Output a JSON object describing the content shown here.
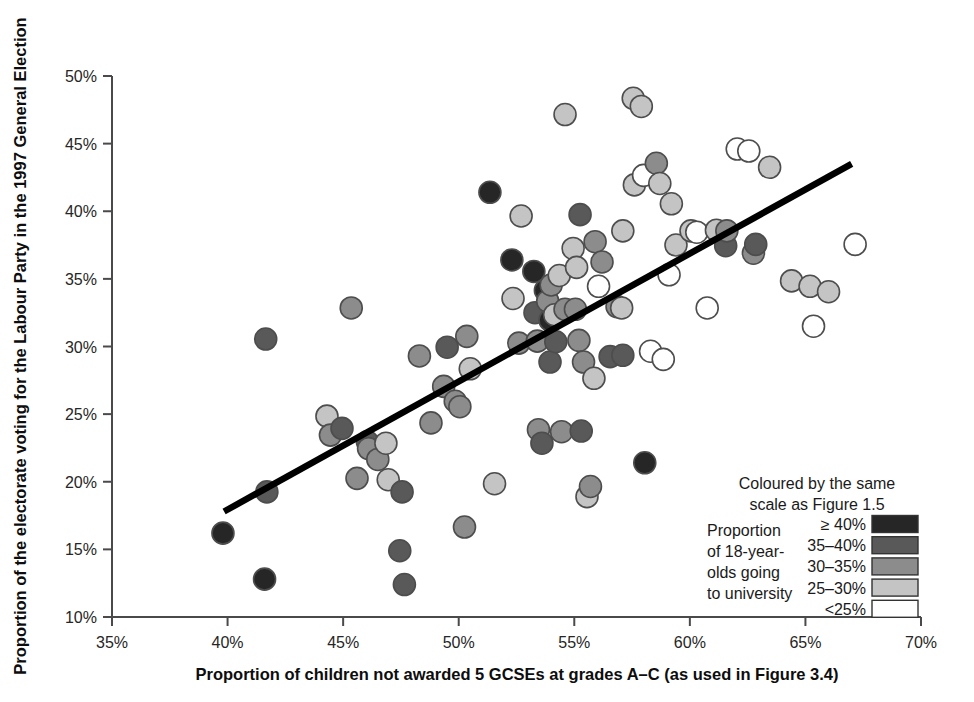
{
  "chart_data": {
    "type": "scatter",
    "title": "",
    "xlabel": "Proportion of children not awarded 5 GCSEs at grades A–C (as used in Figure 3.4)",
    "ylabel": "Proportion of the electorate voting for the Labour Party in the 1997 General Election",
    "xlim": [
      35,
      70
    ],
    "ylim": [
      10,
      50
    ],
    "xticks": [
      "35%",
      "40%",
      "45%",
      "50%",
      "55%",
      "60%",
      "65%",
      "70%"
    ],
    "xtick_values": [
      35,
      40,
      45,
      50,
      55,
      60,
      65,
      70
    ],
    "yticks": [
      "10%",
      "15%",
      "20%",
      "25%",
      "30%",
      "35%",
      "40%",
      "45%",
      "50%"
    ],
    "ytick_values": [
      10,
      15,
      20,
      25,
      30,
      35,
      40,
      45,
      50
    ],
    "grid": false,
    "legend_position": "bottom-right",
    "trendline": {
      "type": "linear",
      "x_start": 39.85,
      "y_start": 17.8,
      "x_end": 67.0,
      "y_end": 43.5
    },
    "color_scale": {
      "bins": [
        ">=40%",
        "35-40%",
        "30-35%",
        "25-30%",
        "<25%"
      ],
      "colors": [
        "#262626",
        "#595959",
        "#8c8c8c",
        "#c4c4c4",
        "#ffffff"
      ]
    },
    "series": [
      {
        "name": "Parliamentary constituencies",
        "point_size_px": 11,
        "points": [
          {
            "x": 39.8,
            "y": 16.2,
            "bin": 0
          },
          {
            "x": 41.6,
            "y": 12.8,
            "bin": 0
          },
          {
            "x": 41.7,
            "y": 19.25,
            "bin": 1
          },
          {
            "x": 41.65,
            "y": 30.55,
            "bin": 1
          },
          {
            "x": 44.3,
            "y": 24.85,
            "bin": 3
          },
          {
            "x": 44.45,
            "y": 23.45,
            "bin": 2
          },
          {
            "x": 44.95,
            "y": 23.95,
            "bin": 1
          },
          {
            "x": 45.35,
            "y": 32.85,
            "bin": 2
          },
          {
            "x": 45.6,
            "y": 20.25,
            "bin": 2
          },
          {
            "x": 46.05,
            "y": 22.95,
            "bin": 1
          },
          {
            "x": 46.1,
            "y": 22.45,
            "bin": 2
          },
          {
            "x": 46.5,
            "y": 21.65,
            "bin": 2
          },
          {
            "x": 46.85,
            "y": 22.85,
            "bin": 3
          },
          {
            "x": 46.95,
            "y": 20.15,
            "bin": 3
          },
          {
            "x": 47.45,
            "y": 14.9,
            "bin": 1
          },
          {
            "x": 47.65,
            "y": 12.4,
            "bin": 1
          },
          {
            "x": 47.55,
            "y": 19.25,
            "bin": 1
          },
          {
            "x": 48.3,
            "y": 29.3,
            "bin": 2
          },
          {
            "x": 48.8,
            "y": 24.35,
            "bin": 2
          },
          {
            "x": 49.35,
            "y": 27.05,
            "bin": 2
          },
          {
            "x": 49.5,
            "y": 29.95,
            "bin": 1
          },
          {
            "x": 49.85,
            "y": 25.95,
            "bin": 2
          },
          {
            "x": 50.05,
            "y": 25.55,
            "bin": 2
          },
          {
            "x": 50.35,
            "y": 30.75,
            "bin": 2
          },
          {
            "x": 50.25,
            "y": 16.65,
            "bin": 2
          },
          {
            "x": 50.5,
            "y": 28.35,
            "bin": 3
          },
          {
            "x": 51.35,
            "y": 41.4,
            "bin": 0
          },
          {
            "x": 51.55,
            "y": 19.85,
            "bin": 3
          },
          {
            "x": 52.3,
            "y": 36.4,
            "bin": 0
          },
          {
            "x": 52.35,
            "y": 33.55,
            "bin": 3
          },
          {
            "x": 52.6,
            "y": 30.25,
            "bin": 2
          },
          {
            "x": 52.7,
            "y": 39.65,
            "bin": 3
          },
          {
            "x": 53.25,
            "y": 35.55,
            "bin": 0
          },
          {
            "x": 53.3,
            "y": 32.5,
            "bin": 1
          },
          {
            "x": 53.4,
            "y": 30.4,
            "bin": 2
          },
          {
            "x": 53.45,
            "y": 23.85,
            "bin": 2
          },
          {
            "x": 53.6,
            "y": 22.85,
            "bin": 1
          },
          {
            "x": 53.75,
            "y": 34.15,
            "bin": 0
          },
          {
            "x": 53.85,
            "y": 33.35,
            "bin": 2
          },
          {
            "x": 53.95,
            "y": 31.95,
            "bin": 0
          },
          {
            "x": 53.95,
            "y": 28.85,
            "bin": 1
          },
          {
            "x": 54.0,
            "y": 34.55,
            "bin": 2
          },
          {
            "x": 54.15,
            "y": 32.35,
            "bin": 3
          },
          {
            "x": 54.2,
            "y": 30.35,
            "bin": 1
          },
          {
            "x": 54.35,
            "y": 35.25,
            "bin": 3
          },
          {
            "x": 54.45,
            "y": 23.7,
            "bin": 2
          },
          {
            "x": 54.6,
            "y": 32.75,
            "bin": 2
          },
          {
            "x": 54.6,
            "y": 47.15,
            "bin": 3
          },
          {
            "x": 54.95,
            "y": 37.25,
            "bin": 3
          },
          {
            "x": 55.05,
            "y": 32.75,
            "bin": 2
          },
          {
            "x": 55.1,
            "y": 35.85,
            "bin": 3
          },
          {
            "x": 55.2,
            "y": 30.45,
            "bin": 2
          },
          {
            "x": 55.25,
            "y": 39.75,
            "bin": 1
          },
          {
            "x": 55.3,
            "y": 23.75,
            "bin": 1
          },
          {
            "x": 55.4,
            "y": 28.85,
            "bin": 2
          },
          {
            "x": 55.55,
            "y": 18.9,
            "bin": 3
          },
          {
            "x": 55.7,
            "y": 19.65,
            "bin": 2
          },
          {
            "x": 55.85,
            "y": 27.65,
            "bin": 3
          },
          {
            "x": 55.9,
            "y": 37.75,
            "bin": 2
          },
          {
            "x": 56.05,
            "y": 34.45,
            "bin": 4
          },
          {
            "x": 56.2,
            "y": 36.25,
            "bin": 2
          },
          {
            "x": 56.55,
            "y": 29.25,
            "bin": 1
          },
          {
            "x": 56.85,
            "y": 32.95,
            "bin": 2
          },
          {
            "x": 57.05,
            "y": 32.85,
            "bin": 3
          },
          {
            "x": 57.1,
            "y": 29.35,
            "bin": 1
          },
          {
            "x": 57.1,
            "y": 38.55,
            "bin": 3
          },
          {
            "x": 57.55,
            "y": 48.35,
            "bin": 3
          },
          {
            "x": 57.6,
            "y": 41.95,
            "bin": 3
          },
          {
            "x": 57.9,
            "y": 47.75,
            "bin": 3
          },
          {
            "x": 58.0,
            "y": 42.65,
            "bin": 4
          },
          {
            "x": 58.05,
            "y": 21.4,
            "bin": 0
          },
          {
            "x": 58.3,
            "y": 29.65,
            "bin": 4
          },
          {
            "x": 58.55,
            "y": 43.55,
            "bin": 2
          },
          {
            "x": 58.7,
            "y": 42.05,
            "bin": 3
          },
          {
            "x": 58.85,
            "y": 29.05,
            "bin": 4
          },
          {
            "x": 59.1,
            "y": 35.3,
            "bin": 4
          },
          {
            "x": 59.2,
            "y": 40.55,
            "bin": 3
          },
          {
            "x": 59.4,
            "y": 37.5,
            "bin": 3
          },
          {
            "x": 60.05,
            "y": 38.55,
            "bin": 3
          },
          {
            "x": 60.3,
            "y": 38.45,
            "bin": 4
          },
          {
            "x": 60.75,
            "y": 32.85,
            "bin": 4
          },
          {
            "x": 61.15,
            "y": 38.6,
            "bin": 3
          },
          {
            "x": 61.55,
            "y": 37.45,
            "bin": 1
          },
          {
            "x": 61.6,
            "y": 38.55,
            "bin": 2
          },
          {
            "x": 62.05,
            "y": 44.6,
            "bin": 4
          },
          {
            "x": 62.55,
            "y": 44.45,
            "bin": 4
          },
          {
            "x": 62.75,
            "y": 36.9,
            "bin": 2
          },
          {
            "x": 62.85,
            "y": 37.55,
            "bin": 1
          },
          {
            "x": 63.45,
            "y": 43.25,
            "bin": 3
          },
          {
            "x": 64.4,
            "y": 34.85,
            "bin": 3
          },
          {
            "x": 65.2,
            "y": 34.45,
            "bin": 3
          },
          {
            "x": 65.35,
            "y": 31.5,
            "bin": 4
          },
          {
            "x": 66.0,
            "y": 34.05,
            "bin": 3
          },
          {
            "x": 67.15,
            "y": 37.55,
            "bin": 4
          }
        ]
      }
    ]
  },
  "legend": {
    "note_line1": "Coloured by the same",
    "note_line2": "scale as Figure 1.5",
    "caption_lines": [
      "Proportion",
      "of 18-year-",
      "olds going",
      "to university"
    ],
    "entries": [
      {
        "label": "≥ 40%",
        "color": "#262626"
      },
      {
        "label": "35–40%",
        "color": "#595959"
      },
      {
        "label": "30–35%",
        "color": "#8c8c8c"
      },
      {
        "label": "25–30%",
        "color": "#c4c4c4"
      },
      {
        "label": "<25%",
        "color": "#ffffff"
      }
    ]
  }
}
